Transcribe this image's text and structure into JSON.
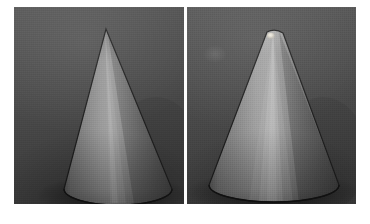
{
  "figure": {
    "type": "image-pair",
    "panel_count": 2,
    "background_color": "#4a4a4a",
    "outline_color": "#1a1a1a",
    "margin_color": "#ffffff"
  },
  "panels": [
    {
      "id": "left",
      "name": "sharp-apex-cone",
      "label": "",
      "object": "cone",
      "apex_type": "sharp",
      "apex_x": 92,
      "apex_y": 22,
      "base_left_x": 50,
      "base_right_x": 158,
      "base_center_y": 186,
      "base_bottom_y": 198,
      "has_specular_apex_dot": false,
      "highlight_position": "center-left vertical band",
      "surface_light": "#9a9a9a",
      "surface_mid": "#767676",
      "surface_dark": "#4f4f4f",
      "shadow_side": "right"
    },
    {
      "id": "right",
      "name": "rounded-apex-cone",
      "label": "",
      "object": "cone",
      "apex_type": "rounded",
      "apex_x": 88,
      "apex_y": 24,
      "base_left_x": 22,
      "base_right_x": 152,
      "base_center_y": 182,
      "base_bottom_y": 198,
      "has_specular_apex_dot": true,
      "specular_dot_x": 84,
      "specular_dot_y": 29,
      "specular_dot_color": "#ece8de",
      "highlight_position": "center vertical band converging at apex",
      "surface_light": "#a2a2a2",
      "surface_mid": "#7a7a7a",
      "surface_dark": "#505050",
      "shadow_side": "right"
    }
  ]
}
